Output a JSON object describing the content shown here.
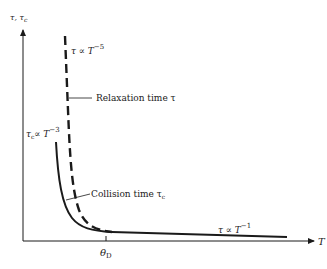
{
  "diagram": {
    "y_axis_label": "τ, τc",
    "y_axis_label_main": "τ, τ",
    "y_axis_label_sub": "c",
    "x_axis_label": "T",
    "x_tick_label_main": "θ",
    "x_tick_label_sub": "D",
    "relaxation_power_law": {
      "main": "τ ∝ T",
      "exp": "−5"
    },
    "collision_power_law": {
      "main": "τ",
      "sub": "c",
      "rest": "∝ T",
      "exp": "−3"
    },
    "high_temp_power_law": {
      "main": "τ ∝ T",
      "exp": "−1"
    },
    "relaxation_label": "Relaxation time τ",
    "collision_label": "Collision time τ",
    "collision_label_sub": "c",
    "curves": [
      {
        "name": "Relaxation time τ",
        "style": "dashed",
        "scaling_low_T": "T^-5"
      },
      {
        "name": "Collision time τc",
        "style": "solid",
        "scaling_low_T": "T^-3",
        "scaling_high_T": "T^-1"
      }
    ],
    "colors": {
      "ink": "#1a1a1a",
      "background": "#ffffff"
    }
  }
}
